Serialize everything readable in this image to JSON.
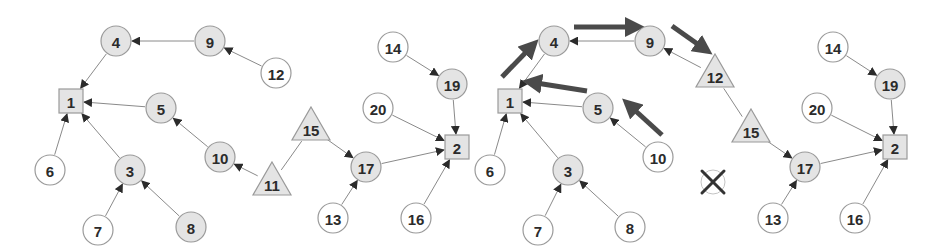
{
  "colors": {
    "gray_fill": "#e4e4e4",
    "white_fill": "#ffffff",
    "edge": "#8a8a8a",
    "thick_arrow": "#4a4a4a",
    "text": "#2b2b2b"
  },
  "graphs": [
    {
      "id": "left",
      "nodes": [
        {
          "id": "1",
          "label": "1",
          "shape": "square",
          "x": 71,
          "y": 101,
          "fill": "gray"
        },
        {
          "id": "4",
          "label": "4",
          "shape": "circle",
          "x": 116,
          "y": 41,
          "fill": "gray"
        },
        {
          "id": "9",
          "label": "9",
          "shape": "circle",
          "x": 210,
          "y": 41,
          "fill": "gray"
        },
        {
          "id": "12",
          "label": "12",
          "shape": "circle",
          "x": 276,
          "y": 73,
          "fill": "white"
        },
        {
          "id": "5",
          "label": "5",
          "shape": "circle",
          "x": 161,
          "y": 108,
          "fill": "gray"
        },
        {
          "id": "3",
          "label": "3",
          "shape": "circle",
          "x": 130,
          "y": 170,
          "fill": "gray"
        },
        {
          "id": "6",
          "label": "6",
          "shape": "circle",
          "x": 50,
          "y": 170,
          "fill": "white"
        },
        {
          "id": "7",
          "label": "7",
          "shape": "circle",
          "x": 98,
          "y": 230,
          "fill": "white"
        },
        {
          "id": "8",
          "label": "8",
          "shape": "circle",
          "x": 191,
          "y": 227,
          "fill": "gray"
        },
        {
          "id": "10",
          "label": "10",
          "shape": "circle",
          "x": 220,
          "y": 157,
          "fill": "gray"
        },
        {
          "id": "11",
          "label": "11",
          "shape": "triangle",
          "x": 272,
          "y": 183,
          "fill": "gray"
        },
        {
          "id": "15",
          "label": "15",
          "shape": "triangle",
          "x": 311,
          "y": 128,
          "fill": "gray"
        },
        {
          "id": "17",
          "label": "17",
          "shape": "circle",
          "x": 366,
          "y": 167,
          "fill": "gray"
        },
        {
          "id": "13",
          "label": "13",
          "shape": "circle",
          "x": 333,
          "y": 218,
          "fill": "white"
        },
        {
          "id": "2",
          "label": "2",
          "shape": "square",
          "x": 457,
          "y": 147,
          "fill": "gray"
        },
        {
          "id": "16",
          "label": "16",
          "shape": "circle",
          "x": 416,
          "y": 218,
          "fill": "white"
        },
        {
          "id": "19",
          "label": "19",
          "shape": "circle",
          "x": 452,
          "y": 84,
          "fill": "gray"
        },
        {
          "id": "14",
          "label": "14",
          "shape": "circle",
          "x": 393,
          "y": 47,
          "fill": "white"
        },
        {
          "id": "20",
          "label": "20",
          "shape": "circle",
          "x": 378,
          "y": 108,
          "fill": "white"
        }
      ],
      "edges": [
        {
          "from": "4",
          "to": "1",
          "directed": true
        },
        {
          "from": "9",
          "to": "4",
          "directed": true
        },
        {
          "from": "12",
          "to": "9",
          "directed": true
        },
        {
          "from": "5",
          "to": "1",
          "directed": true
        },
        {
          "from": "10",
          "to": "5",
          "directed": true
        },
        {
          "from": "11",
          "to": "10",
          "directed": true
        },
        {
          "from": "11",
          "to": "15",
          "directed": false
        },
        {
          "from": "15",
          "to": "17",
          "directed": true
        },
        {
          "from": "6",
          "to": "1",
          "directed": true
        },
        {
          "from": "3",
          "to": "1",
          "directed": true
        },
        {
          "from": "7",
          "to": "3",
          "directed": true
        },
        {
          "from": "8",
          "to": "3",
          "directed": true
        },
        {
          "from": "13",
          "to": "17",
          "directed": true
        },
        {
          "from": "17",
          "to": "2",
          "directed": true
        },
        {
          "from": "16",
          "to": "2",
          "directed": true
        },
        {
          "from": "20",
          "to": "2",
          "directed": true
        },
        {
          "from": "19",
          "to": "2",
          "directed": true
        },
        {
          "from": "14",
          "to": "19",
          "directed": true
        }
      ],
      "thick_arrows": [],
      "removed_nodes": []
    },
    {
      "id": "right",
      "nodes": [
        {
          "id": "1",
          "label": "1",
          "shape": "square",
          "x": 510,
          "y": 101,
          "fill": "gray"
        },
        {
          "id": "4",
          "label": "4",
          "shape": "circle",
          "x": 554,
          "y": 41,
          "fill": "gray"
        },
        {
          "id": "9",
          "label": "9",
          "shape": "circle",
          "x": 650,
          "y": 41,
          "fill": "gray"
        },
        {
          "id": "12",
          "label": "12",
          "shape": "triangle",
          "x": 715,
          "y": 75,
          "fill": "gray"
        },
        {
          "id": "5",
          "label": "5",
          "shape": "circle",
          "x": 598,
          "y": 108,
          "fill": "gray"
        },
        {
          "id": "10",
          "label": "10",
          "shape": "circle",
          "x": 658,
          "y": 157,
          "fill": "white"
        },
        {
          "id": "3",
          "label": "3",
          "shape": "circle",
          "x": 568,
          "y": 170,
          "fill": "gray"
        },
        {
          "id": "6",
          "label": "6",
          "shape": "circle",
          "x": 490,
          "y": 170,
          "fill": "white"
        },
        {
          "id": "7",
          "label": "7",
          "shape": "circle",
          "x": 538,
          "y": 230,
          "fill": "white"
        },
        {
          "id": "8",
          "label": "8",
          "shape": "circle",
          "x": 630,
          "y": 227,
          "fill": "white"
        },
        {
          "id": "15",
          "label": "15",
          "shape": "triangle",
          "x": 751,
          "y": 130,
          "fill": "gray"
        },
        {
          "id": "17",
          "label": "17",
          "shape": "circle",
          "x": 805,
          "y": 167,
          "fill": "gray"
        },
        {
          "id": "13",
          "label": "13",
          "shape": "circle",
          "x": 773,
          "y": 218,
          "fill": "white"
        },
        {
          "id": "2",
          "label": "2",
          "shape": "square",
          "x": 895,
          "y": 147,
          "fill": "gray"
        },
        {
          "id": "16",
          "label": "16",
          "shape": "circle",
          "x": 855,
          "y": 218,
          "fill": "white"
        },
        {
          "id": "19",
          "label": "19",
          "shape": "circle",
          "x": 890,
          "y": 84,
          "fill": "gray"
        },
        {
          "id": "14",
          "label": "14",
          "shape": "circle",
          "x": 833,
          "y": 47,
          "fill": "white"
        },
        {
          "id": "20",
          "label": "20",
          "shape": "circle",
          "x": 817,
          "y": 108,
          "fill": "white"
        }
      ],
      "edges": [
        {
          "from": "4",
          "to": "1",
          "directed": true
        },
        {
          "from": "9",
          "to": "4",
          "directed": true
        },
        {
          "from": "12",
          "to": "9",
          "directed": true
        },
        {
          "from": "12",
          "to": "15",
          "directed": false
        },
        {
          "from": "5",
          "to": "1",
          "directed": true
        },
        {
          "from": "10",
          "to": "5",
          "directed": true
        },
        {
          "from": "15",
          "to": "17",
          "directed": true
        },
        {
          "from": "6",
          "to": "1",
          "directed": true
        },
        {
          "from": "3",
          "to": "1",
          "directed": true
        },
        {
          "from": "7",
          "to": "3",
          "directed": true
        },
        {
          "from": "8",
          "to": "3",
          "directed": true
        },
        {
          "from": "13",
          "to": "17",
          "directed": true
        },
        {
          "from": "17",
          "to": "2",
          "directed": true
        },
        {
          "from": "16",
          "to": "2",
          "directed": true
        },
        {
          "from": "20",
          "to": "2",
          "directed": true
        },
        {
          "from": "19",
          "to": "2",
          "directed": true
        },
        {
          "from": "14",
          "to": "19",
          "directed": true
        }
      ],
      "thick_arrows": [
        {
          "x1": 502,
          "y1": 77,
          "x2": 533,
          "y2": 45
        },
        {
          "x1": 574,
          "y1": 27,
          "x2": 637,
          "y2": 27
        },
        {
          "x1": 672,
          "y1": 26,
          "x2": 706,
          "y2": 50
        },
        {
          "x1": 587,
          "y1": 91,
          "x2": 530,
          "y2": 82
        },
        {
          "x1": 662,
          "y1": 135,
          "x2": 628,
          "y2": 104
        }
      ],
      "removed_nodes": [
        {
          "label": "11",
          "x": 713,
          "y": 182,
          "marker": "x-cross"
        }
      ]
    }
  ]
}
